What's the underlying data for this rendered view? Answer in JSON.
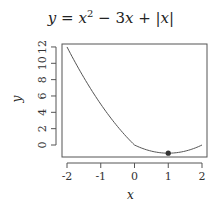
{
  "chart_data": {
    "type": "line",
    "xlabel": "x",
    "ylabel": "y",
    "xlim": [
      -2,
      2
    ],
    "ylim": [
      -1,
      12
    ],
    "x_ticks": [
      "-2",
      "-1",
      "0",
      "1",
      "2"
    ],
    "y_ticks": [
      "0",
      "2",
      "4",
      "6",
      "8",
      "10",
      "12"
    ],
    "grid": false,
    "legend": null,
    "series": [
      {
        "name": "y = x^2 - 3x + |x|",
        "x": [
          -2,
          -1.5,
          -1,
          -0.5,
          0,
          0.5,
          1,
          1.5,
          2
        ],
        "values": [
          12,
          8.25,
          5,
          2.25,
          0,
          -0.75,
          -1,
          -0.75,
          0
        ]
      }
    ],
    "annotations": [
      {
        "type": "point",
        "x": 1,
        "y": -1,
        "label": "minimum"
      }
    ]
  },
  "title_parts": {
    "lhs": "y",
    "eq": " = ",
    "x": "x",
    "exp": "2",
    "mid": " − 3",
    "x2": "x",
    "plus": " + |",
    "x3": "x",
    "bar": "|"
  },
  "colors": {
    "line": "#555555",
    "point": "#333333",
    "axis": "#555555"
  }
}
